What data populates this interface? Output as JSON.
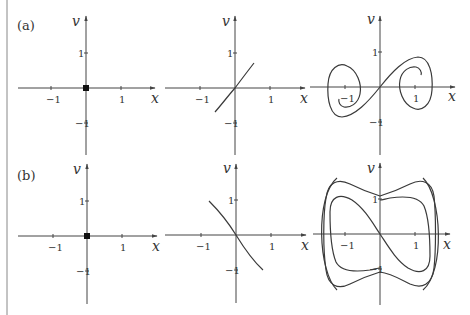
{
  "figure": {
    "rows": [
      {
        "label": "(a)",
        "panels": [
          {
            "id": "a1",
            "x_label": "x",
            "y_label": "v",
            "x_ticks": [
              "−1",
              "1"
            ],
            "y_ticks": [
              "1",
              "−1"
            ],
            "content": "fixed point at origin"
          },
          {
            "id": "a2",
            "x_label": "x",
            "y_label": "v",
            "x_ticks": [
              "−1",
              "1"
            ],
            "y_ticks": [
              "1",
              "−1"
            ],
            "content": "short increasing curve through origin"
          },
          {
            "id": "a3",
            "x_label": "x",
            "y_label": "v",
            "x_ticks": [
              "−1",
              "1"
            ],
            "y_ticks": [
              "1",
              "−1"
            ],
            "content": "curve through origin spiraling into two loops"
          }
        ]
      },
      {
        "label": "(b)",
        "panels": [
          {
            "id": "b1",
            "x_label": "x",
            "y_label": "v",
            "x_ticks": [
              "−1",
              "1"
            ],
            "y_ticks": [
              "1",
              "−1"
            ],
            "content": "fixed point at origin"
          },
          {
            "id": "b2",
            "x_label": "x",
            "y_label": "v",
            "x_ticks": [
              "−1",
              "1"
            ],
            "y_ticks": [
              "1",
              "−1"
            ],
            "content": "short decreasing curve through origin"
          },
          {
            "id": "b3",
            "x_label": "x",
            "y_label": "v",
            "x_ticks": [
              "−1",
              "1"
            ],
            "y_ticks": [
              "1",
              "−1"
            ],
            "content": "nested closed curves with decreasing curve through origin"
          }
        ]
      }
    ]
  },
  "colors": {
    "curve": "#3a3a3a",
    "axis": "#444444",
    "background": "#ffffff"
  }
}
